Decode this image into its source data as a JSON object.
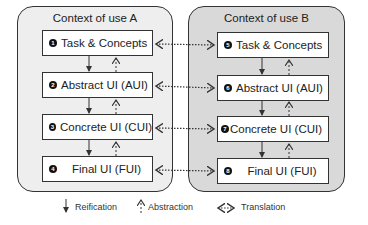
{
  "contexts": [
    {
      "title": "Context of use A",
      "levels": [
        {
          "number": "1",
          "label": "Task & Concepts"
        },
        {
          "number": "2",
          "label": "Abstract UI (AUI)"
        },
        {
          "number": "3",
          "label": "Concrete UI (CUI)"
        },
        {
          "number": "4",
          "label": "Final UI (FUI)"
        }
      ]
    },
    {
      "title": "Context of use B",
      "levels": [
        {
          "number": "5",
          "label": "Task & Concepts"
        },
        {
          "number": "6",
          "label": "Abstract UI (AUI)"
        },
        {
          "number": "7",
          "label": "Concrete UI (CUI)"
        },
        {
          "number": "8",
          "label": "Final UI (FUI)"
        }
      ]
    }
  ],
  "legend": {
    "reification": "Reification",
    "abstraction": "Abstraction",
    "translation": "Translation"
  },
  "colors": {
    "context_a_bg": "#eeeeee",
    "context_b_bg": "#d9d9d9",
    "box_bg": "#ffffff",
    "stroke": "#333333"
  }
}
